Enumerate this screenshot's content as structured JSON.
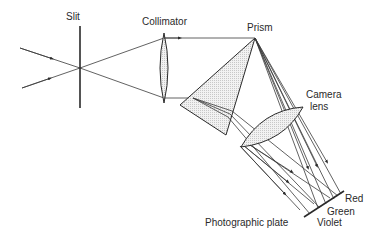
{
  "diagram": {
    "labels": {
      "slit": "Slit",
      "collimator": "Collimator",
      "prism": "Prism",
      "camera_lens_line1": "Camera",
      "camera_lens_line2": "lens",
      "photographic_plate": "Photographic plate",
      "red": "Red",
      "green": "Green",
      "violet": "Violet"
    },
    "colors": {
      "line": "#2a2a2a",
      "fill": "#e6e6e6",
      "background": "#ffffff"
    }
  }
}
